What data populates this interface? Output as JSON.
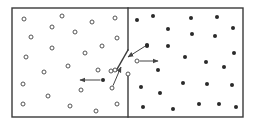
{
  "diagram": {
    "colors": {
      "wall": "#3a3a3a",
      "open_molecule_stroke": "#555555",
      "filled_molecule": "#2a2a2a",
      "arrow": "#444444",
      "background": "#ffffff"
    },
    "box": {
      "x": 12,
      "y": 8,
      "width": 231,
      "height": 109
    },
    "partition": {
      "x": 128,
      "upper_wall": {
        "y1": 8,
        "y2": 50
      },
      "lower_wall": {
        "y1": 73,
        "y2": 117
      },
      "door": {
        "x1": 128,
        "y1": 50,
        "x2": 116,
        "y2": 71
      }
    },
    "left_chamber": {
      "description": "open circles (slow / cold molecules)",
      "molecules": [
        [
          24,
          19
        ],
        [
          62,
          16
        ],
        [
          52,
          27
        ],
        [
          92,
          22
        ],
        [
          115,
          18
        ],
        [
          31,
          37
        ],
        [
          75,
          32
        ],
        [
          52,
          48
        ],
        [
          85,
          53
        ],
        [
          117,
          38
        ],
        [
          26,
          57
        ],
        [
          102,
          46
        ],
        [
          68,
          66
        ],
        [
          44,
          72
        ],
        [
          98,
          70
        ],
        [
          23,
          84
        ],
        [
          48,
          96
        ],
        [
          81,
          90
        ],
        [
          111,
          71
        ],
        [
          23,
          104
        ],
        [
          70,
          106
        ],
        [
          96,
          111
        ],
        [
          117,
          104
        ]
      ]
    },
    "right_chamber": {
      "description": "filled circles (fast / hot molecules)",
      "molecules": [
        [
          137,
          20
        ],
        [
          153,
          16
        ],
        [
          168,
          29
        ],
        [
          191,
          18
        ],
        [
          217,
          17
        ],
        [
          233,
          28
        ],
        [
          192,
          34
        ],
        [
          215,
          36
        ],
        [
          147,
          46
        ],
        [
          168,
          46
        ],
        [
          234,
          53
        ],
        [
          185,
          57
        ],
        [
          206,
          62
        ],
        [
          224,
          67
        ],
        [
          158,
          70
        ],
        [
          141,
          87
        ],
        [
          183,
          83
        ],
        [
          207,
          84
        ],
        [
          232,
          85
        ],
        [
          160,
          93
        ],
        [
          143,
          107
        ],
        [
          173,
          109
        ],
        [
          199,
          104
        ],
        [
          219,
          104
        ],
        [
          236,
          107
        ]
      ]
    },
    "moving_molecules": [
      {
        "kind": "filled",
        "at": [
          103,
          80
        ],
        "arrow_to": [
          80,
          80
        ],
        "label": "fast molecule moving left"
      },
      {
        "kind": "filled",
        "at": [
          147,
          45
        ],
        "arrow_to": [
          128,
          57
        ],
        "label": "fast molecule approaching door"
      },
      {
        "kind": "open",
        "at": [
          137,
          61
        ],
        "arrow_to": [
          158,
          61
        ],
        "label": "slow molecule passed through door"
      },
      {
        "kind": "open",
        "at": [
          112,
          88
        ],
        "arrow_to": [
          121,
          67
        ],
        "label": "slow molecule approaching door"
      }
    ],
    "door_markers": [
      {
        "kind": "open",
        "at": [
          115,
          70
        ]
      },
      {
        "kind": "open",
        "at": [
          128,
          74
        ]
      }
    ]
  }
}
